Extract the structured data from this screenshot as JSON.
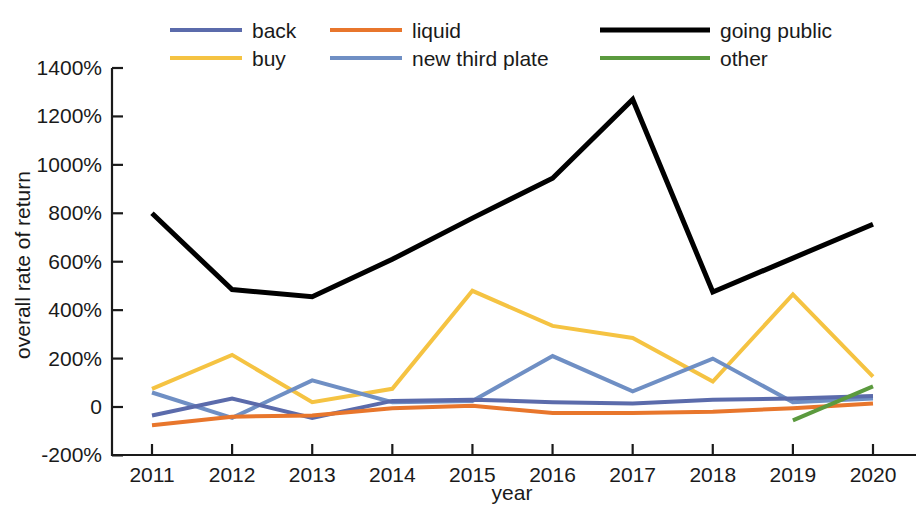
{
  "chart_data": {
    "type": "line",
    "title": "",
    "xlabel": "year",
    "ylabel": "overall rate of return",
    "categories": [
      "2011",
      "2012",
      "2013",
      "2014",
      "2015",
      "2016",
      "2017",
      "2018",
      "2019",
      "2020"
    ],
    "x": [
      2011,
      2012,
      2013,
      2014,
      2015,
      2016,
      2017,
      2018,
      2019,
      2020
    ],
    "xlim": [
      2011,
      2020
    ],
    "ylim": [
      -200,
      1400
    ],
    "ytick_labels": [
      "1400%",
      "1200%",
      "1000%",
      "800%",
      "600%",
      "400%",
      "200%",
      "0",
      "-200%"
    ],
    "ytick_values": [
      1400,
      1200,
      1000,
      800,
      600,
      400,
      200,
      0,
      -200
    ],
    "yunit": "%",
    "grid": false,
    "legend_position": "top",
    "legend_columns": 3,
    "series": [
      {
        "name": "back",
        "color": "#5b6bab",
        "width": 4,
        "values": [
          -35,
          35,
          -45,
          25,
          30,
          20,
          15,
          30,
          35,
          45
        ]
      },
      {
        "name": "buy",
        "color": "#f5c342",
        "width": 4,
        "values": [
          75,
          215,
          20,
          75,
          480,
          335,
          285,
          105,
          465,
          125
        ]
      },
      {
        "name": "liquid",
        "color": "#e8762c",
        "width": 4,
        "values": [
          -75,
          -40,
          -35,
          -5,
          5,
          -25,
          -25,
          -20,
          -5,
          15
        ]
      },
      {
        "name": "new third plate",
        "color": "#6f8fc4",
        "width": 4,
        "values": [
          60,
          -45,
          110,
          20,
          25,
          210,
          65,
          200,
          20,
          35
        ]
      },
      {
        "name": "going public",
        "color": "#000000",
        "width": 5,
        "values": [
          800,
          485,
          455,
          610,
          780,
          945,
          1270,
          475,
          615,
          755
        ]
      },
      {
        "name": "other",
        "color": "#5b9a3e",
        "width": 4,
        "values": [
          null,
          null,
          null,
          null,
          null,
          null,
          null,
          null,
          -55,
          85
        ]
      }
    ]
  },
  "legend": {
    "entries": [
      {
        "label": "back",
        "series": "back"
      },
      {
        "label": "liquid",
        "series": "liquid"
      },
      {
        "label": "going public",
        "series": "going public"
      },
      {
        "label": "buy",
        "series": "buy"
      },
      {
        "label": "new third plate",
        "series": "new third plate"
      },
      {
        "label": "other",
        "series": "other"
      }
    ]
  }
}
